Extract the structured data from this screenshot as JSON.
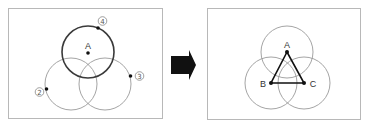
{
  "left_panel": {
    "circles": [
      {
        "id": "top",
        "cx": 88,
        "cy": 52,
        "r": 26,
        "style": "thick"
      },
      {
        "id": "bottom-left",
        "cx": 71,
        "cy": 84,
        "r": 26,
        "style": "thin"
      },
      {
        "id": "bottom-right",
        "cx": 105,
        "cy": 84,
        "r": 26,
        "style": "thin"
      }
    ],
    "center_point": {
      "label": "A",
      "x": 88,
      "y": 53
    },
    "markers": [
      {
        "label": "④",
        "number": "4",
        "dot_x": 98,
        "dot_y": 28,
        "label_x": 102,
        "label_y": 21
      },
      {
        "label": "③",
        "number": "3",
        "dot_x": 130,
        "dot_y": 76,
        "label_x": 139,
        "label_y": 76
      },
      {
        "label": "②",
        "number": "2",
        "dot_x": 46,
        "dot_y": 89,
        "label_x": 39,
        "label_y": 92
      }
    ]
  },
  "arrow": {
    "direction": "right"
  },
  "right_panel": {
    "circles": [
      {
        "id": "top",
        "cx": 287,
        "cy": 52,
        "r": 26,
        "style": "thin"
      },
      {
        "id": "bottom-left",
        "cx": 271,
        "cy": 83,
        "r": 26,
        "style": "thin"
      },
      {
        "id": "bottom-right",
        "cx": 304,
        "cy": 83,
        "r": 26,
        "style": "thin"
      }
    ],
    "points": [
      {
        "label": "A",
        "x": 287,
        "y": 52
      },
      {
        "label": "B",
        "x": 271,
        "y": 83
      },
      {
        "label": "C",
        "x": 304,
        "y": 83
      }
    ],
    "triangle": "ABC"
  },
  "labels": {
    "left_A": "A",
    "marker_4": "4",
    "marker_3": "3",
    "marker_2": "2",
    "right_A": "A",
    "right_B": "B",
    "right_C": "C"
  }
}
